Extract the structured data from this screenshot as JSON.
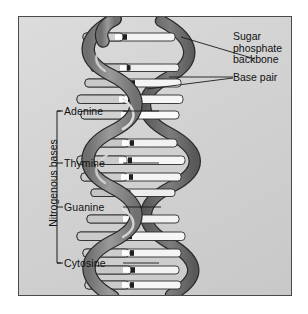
{
  "figure": {
    "type": "diagram",
    "frame": {
      "border_color": "#4a4a4a",
      "background_color": "#d4d4d4"
    }
  },
  "labels": {
    "left_group_title": "Nitrogenous bases",
    "bases": [
      {
        "name": "Adenine",
        "y": 112
      },
      {
        "name": "Thymine",
        "y": 163
      },
      {
        "name": "Guanine",
        "y": 205
      },
      {
        "name": "Cytosine",
        "y": 260
      }
    ],
    "right": [
      {
        "name": "Sugar phosphate backbone",
        "lines": [
          "Sugar",
          "phosphate",
          "backbone"
        ]
      },
      {
        "name": "Base pair",
        "lines": [
          "Base pair"
        ]
      }
    ]
  },
  "structure": {
    "strand_color": "#8c8c8c",
    "strand_shadow": "#5e5e5e",
    "rung_color": "#f2f2f2",
    "outline_color": "#2b2b2b",
    "turns": 4,
    "base_pairs": [
      {
        "left": "G",
        "right": "C"
      },
      {
        "left": "A",
        "right": "T"
      },
      {
        "left": "T",
        "right": "A"
      },
      {
        "left": "A",
        "right": "T"
      },
      {
        "left": "C",
        "right": "G"
      },
      {
        "left": "G",
        "right": "C"
      },
      {
        "left": "T",
        "right": "A"
      },
      {
        "left": "A",
        "right": "T"
      },
      {
        "left": "G",
        "right": "C"
      },
      {
        "left": "T",
        "right": "A"
      },
      {
        "left": "A",
        "right": "T"
      },
      {
        "left": "A",
        "right": "T"
      },
      {
        "left": "T",
        "right": "A"
      },
      {
        "left": "A",
        "right": "G"
      }
    ]
  }
}
